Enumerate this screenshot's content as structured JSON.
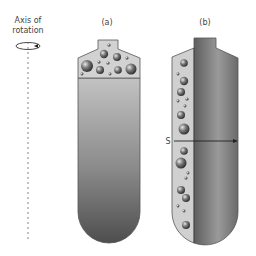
{
  "axis": {
    "label_line1": "Axis of",
    "label_line2": "rotation"
  },
  "panel_a": {
    "label": "(a)"
  },
  "panel_b": {
    "label": "(b)",
    "arrow_label": "S"
  },
  "colors": {
    "bubble_region": "#d4d4d4",
    "tube_dark": "#5a5a5a",
    "tube_light": "#b8b8b8",
    "outline": "#444444"
  }
}
